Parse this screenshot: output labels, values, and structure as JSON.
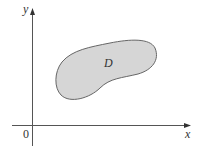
{
  "figure": {
    "x_axis_label": "x",
    "y_axis_label": "y",
    "origin_label": "0",
    "region_label": "D",
    "colors": {
      "axis": "#555555",
      "region_fill": "#d6d6d6",
      "region_stroke": "#666666",
      "background": "#ffffff"
    }
  }
}
